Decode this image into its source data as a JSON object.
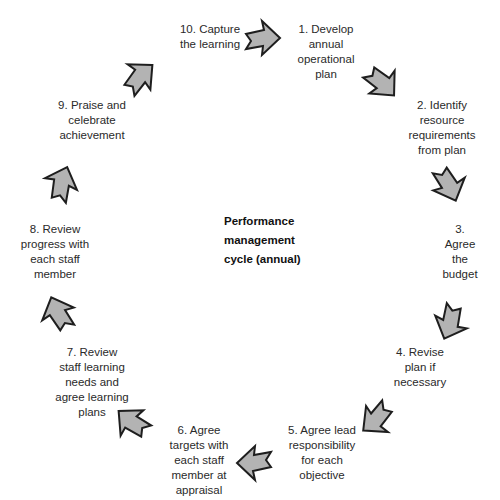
{
  "diagram": {
    "type": "cycle",
    "title": "Performance\nmanagement\ncycle (annual)",
    "arrow_fill": "#b3b3b3",
    "arrow_stroke": "#1e1e1e",
    "steps": [
      {
        "number": 1,
        "label": "1. Develop\nannual\noperational\nplan"
      },
      {
        "number": 2,
        "label": "2. Identify\nresource\nrequirements\nfrom plan"
      },
      {
        "number": 3,
        "label": "3. Agree the\nbudget"
      },
      {
        "number": 4,
        "label": "4. Revise\nplan if\nnecessary"
      },
      {
        "number": 5,
        "label": "5. Agree lead\nresponsibility\nfor each\nobjective"
      },
      {
        "number": 6,
        "label": "6. Agree\ntargets with\neach staff\nmember at\nappraisal"
      },
      {
        "number": 7,
        "label": "7. Review\nstaff learning\nneeds and\nagree learning\nplans"
      },
      {
        "number": 8,
        "label": "8. Review\nprogress with\neach staff\nmember"
      },
      {
        "number": 9,
        "label": "9. Praise and\ncelebrate\nachievement"
      },
      {
        "number": 10,
        "label": "10. Capture\nthe learning"
      }
    ],
    "arrows": [
      {
        "from": 10,
        "to": 1,
        "icon": "arrow-right-icon"
      },
      {
        "from": 1,
        "to": 2,
        "icon": "arrow-down-right-icon"
      },
      {
        "from": 2,
        "to": 3,
        "icon": "arrow-down-right-icon"
      },
      {
        "from": 3,
        "to": 4,
        "icon": "arrow-down-icon"
      },
      {
        "from": 4,
        "to": 5,
        "icon": "arrow-down-left-icon"
      },
      {
        "from": 5,
        "to": 6,
        "icon": "arrow-left-icon"
      },
      {
        "from": 6,
        "to": 7,
        "icon": "arrow-up-left-icon"
      },
      {
        "from": 7,
        "to": 8,
        "icon": "arrow-up-icon"
      },
      {
        "from": 8,
        "to": 9,
        "icon": "arrow-up-icon"
      },
      {
        "from": 9,
        "to": 10,
        "icon": "arrow-up-right-icon"
      }
    ]
  }
}
